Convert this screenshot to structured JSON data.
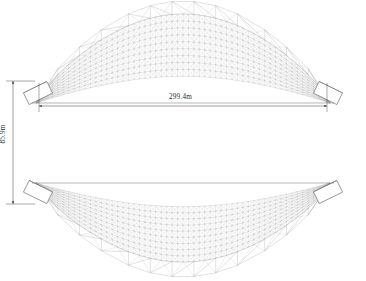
{
  "drawing": {
    "type": "cad-elevation",
    "subject": "lenticular lattice arch bridge",
    "background_color": "#ffffff",
    "line_color": "#555555",
    "mesh_color": "#8a8a8a",
    "dim_color": "#2b2b2b"
  },
  "dimensions": {
    "span": {
      "value": "299.4m",
      "orientation": "horizontal"
    },
    "rise": {
      "value": "85.9m",
      "orientation": "vertical"
    }
  },
  "geometry": {
    "left_support_x": 36,
    "right_support_x": 330,
    "deck_top_y": 103,
    "deck_bottom_y": 183,
    "upper_apex_y": 14,
    "lower_apex_y": 262,
    "mesh_rings": 9,
    "mesh_bays": 54,
    "peak_count": 13
  }
}
